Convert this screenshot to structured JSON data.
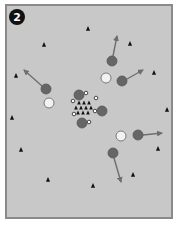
{
  "diagram": {
    "badge": {
      "number": "2",
      "x": 17,
      "y": 17,
      "r": 8,
      "fill": "#111111",
      "text_color": "#ffffff"
    },
    "field": {
      "x": 6,
      "y": 5,
      "width": 166,
      "height": 213,
      "fill": "#c8c8c8",
      "border": "#8a8a8a",
      "border_width": 2
    },
    "colors": {
      "player_dark": "#666666",
      "player_dark_stroke": "#555555",
      "player_light": "#f2f2f2",
      "player_light_stroke": "#7a7a7a",
      "cone": "#111111",
      "arrow": "#6e6e6e",
      "small_marker_fill": "#ffffff",
      "small_marker_stroke": "#222222"
    },
    "cones": [
      {
        "x": 44,
        "y": 45
      },
      {
        "x": 88,
        "y": 29
      },
      {
        "x": 130,
        "y": 44
      },
      {
        "x": 16,
        "y": 76
      },
      {
        "x": 154,
        "y": 73
      },
      {
        "x": 12,
        "y": 118
      },
      {
        "x": 167,
        "y": 110
      },
      {
        "x": 21,
        "y": 150
      },
      {
        "x": 158,
        "y": 149
      },
      {
        "x": 48,
        "y": 180
      },
      {
        "x": 93,
        "y": 186
      },
      {
        "x": 133,
        "y": 175
      }
    ],
    "center_cones": [
      {
        "x": 79,
        "y": 103
      },
      {
        "x": 84,
        "y": 103
      },
      {
        "x": 89,
        "y": 103
      },
      {
        "x": 76,
        "y": 108
      },
      {
        "x": 81,
        "y": 108
      },
      {
        "x": 86,
        "y": 108
      },
      {
        "x": 91,
        "y": 108
      },
      {
        "x": 78,
        "y": 113
      },
      {
        "x": 83,
        "y": 113
      },
      {
        "x": 88,
        "y": 113
      }
    ],
    "small_markers": [
      {
        "x": 86,
        "y": 93
      },
      {
        "x": 96,
        "y": 98
      },
      {
        "x": 73,
        "y": 101
      },
      {
        "x": 74,
        "y": 114
      },
      {
        "x": 95,
        "y": 111
      },
      {
        "x": 89,
        "y": 122
      }
    ],
    "dark_players": [
      {
        "x": 79,
        "y": 95,
        "r": 5
      },
      {
        "x": 102,
        "y": 111,
        "r": 5
      },
      {
        "x": 82,
        "y": 123,
        "r": 5
      },
      {
        "x": 46,
        "y": 89,
        "r": 5
      },
      {
        "x": 112,
        "y": 61,
        "r": 5
      },
      {
        "x": 122,
        "y": 81,
        "r": 5
      },
      {
        "x": 138,
        "y": 135,
        "r": 5
      },
      {
        "x": 113,
        "y": 153,
        "r": 5
      }
    ],
    "light_players": [
      {
        "x": 49,
        "y": 103,
        "r": 5
      },
      {
        "x": 106,
        "y": 78,
        "r": 5
      },
      {
        "x": 121,
        "y": 136,
        "r": 5
      }
    ],
    "arrows": [
      {
        "x1": 42,
        "y1": 86,
        "x2": 24,
        "y2": 70
      },
      {
        "x1": 113,
        "y1": 56,
        "x2": 117,
        "y2": 36
      },
      {
        "x1": 127,
        "y1": 79,
        "x2": 143,
        "y2": 70
      },
      {
        "x1": 143,
        "y1": 135,
        "x2": 162,
        "y2": 133
      },
      {
        "x1": 114,
        "y1": 158,
        "x2": 121,
        "y2": 182
      }
    ]
  }
}
